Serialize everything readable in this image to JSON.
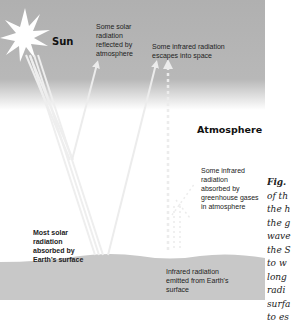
{
  "diagram": {
    "regions": {
      "space_label": "Sun",
      "atmosphere_label": "Atmosphere"
    },
    "labels": {
      "reflected": "Some solar\nradiation\nreflected by\natmosphere",
      "escapes": "Some infrared radiation\nescapes into space",
      "absorbed_gases": "Some infrared\nradiation\nabsorbed by\ngreenhouse gases\nin atmosphere",
      "absorbed_surface": "Most solar\nradiation\nabsorbed by\nEarth's surface",
      "emitted": "Infrared radiation\nemitted from Earth's\nsurface"
    },
    "caption": {
      "fig": "Fig.",
      "lines": "of th\nthe h\nthe g\nwave\nthe S\nto w\nlong\nradi\nsurfa\nto es"
    },
    "colors": {
      "sky": "#b3b3b3",
      "ground": "#c8c8c8",
      "arrow": "#e8e8e8",
      "text": "#222222"
    }
  }
}
